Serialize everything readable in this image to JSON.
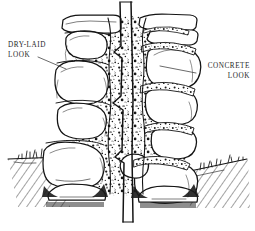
{
  "figure": {
    "caption_fragment": "",
    "background_color": "#ffffff",
    "ink_color": "#141414"
  },
  "labels": {
    "left": {
      "line1": "DRY-LAID",
      "line2": "LOOK"
    },
    "right": {
      "line1": "CONCRETE",
      "line2": "LOOK"
    }
  },
  "annotations": {
    "leader_left": "leader-line-to-dry-laid-stone",
    "leader_right": "leader-line-to-concrete-joint"
  },
  "diagram": {
    "split_line": "jagged vertical break line",
    "core": "stippled concrete core",
    "left_side": "dry-laid stacked stones with tight open joints",
    "right_side": "mortared stones with stippled concrete joints",
    "ground": "grade line with grass tufts and hatched soil",
    "footing": "buried base course below grade"
  }
}
